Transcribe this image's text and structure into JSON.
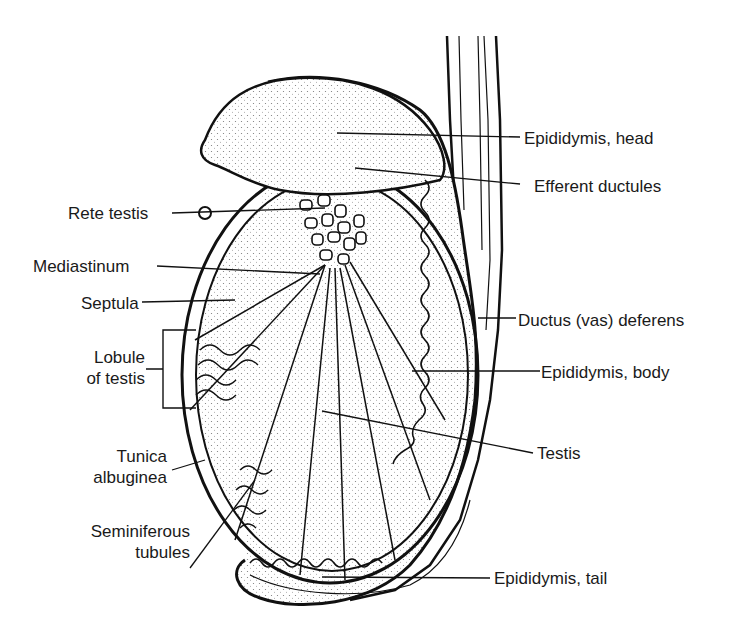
{
  "diagram": {
    "colors": {
      "ink": "#111111",
      "fill": "#f4f4f4",
      "background": "#ffffff"
    },
    "labels_left": [
      {
        "id": "rete-testis",
        "text": "Rete testis"
      },
      {
        "id": "mediastinum",
        "text": "Mediastinum"
      },
      {
        "id": "septula",
        "text": "Septula"
      },
      {
        "id": "lobule-of-testis",
        "line1": "Lobule",
        "line2": "of testis"
      },
      {
        "id": "tunica-albuginea",
        "line1": "Tunica",
        "line2": "albuginea"
      },
      {
        "id": "seminiferous-tubules",
        "line1": "Seminiferous",
        "line2": "tubules"
      }
    ],
    "labels_right": [
      {
        "id": "epididymis-head",
        "text": "Epididymis, head"
      },
      {
        "id": "efferent-ductules",
        "text": "Efferent ductules"
      },
      {
        "id": "ductus-deferens",
        "text": "Ductus (vas) deferens"
      },
      {
        "id": "epididymis-body",
        "text": "Epididymis, body"
      },
      {
        "id": "testis",
        "text": "Testis"
      },
      {
        "id": "epididymis-tail",
        "text": "Epididymis, tail"
      }
    ]
  }
}
